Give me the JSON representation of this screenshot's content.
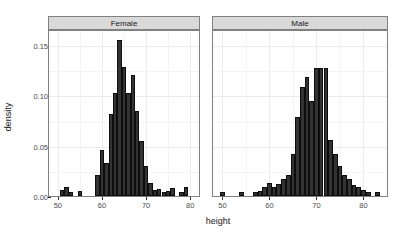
{
  "chart_data": {
    "type": "bar",
    "title": "",
    "subtitle": "",
    "xlabel": "height",
    "ylabel": "density",
    "grid": true,
    "legend": "none",
    "facet_variable": "sex",
    "bin_width": 1,
    "xlim": [
      48,
      85
    ],
    "ylim": [
      0,
      0.165
    ],
    "x_ticks": [
      50,
      60,
      70,
      80
    ],
    "x_tick_labels": [
      "50",
      "60",
      "70",
      "80"
    ],
    "y_ticks": [
      0.0,
      0.05,
      0.1,
      0.15
    ],
    "y_tick_labels": [
      "0.00",
      "0.05",
      "0.10",
      "0.15"
    ],
    "panels": [
      {
        "label": "Female",
        "xlim": [
          48,
          82
        ],
        "x": [
          51,
          52,
          53,
          54,
          55,
          56,
          57,
          58,
          59,
          60,
          61,
          62,
          63,
          64,
          65,
          66,
          67,
          68,
          69,
          70,
          71,
          72,
          73,
          74,
          75,
          76,
          77,
          78,
          79,
          80
        ],
        "values": [
          0.006,
          0.009,
          0.004,
          0.0,
          0.005,
          0.0,
          0.0,
          0.0,
          0.021,
          0.046,
          0.033,
          0.082,
          0.102,
          0.155,
          0.128,
          0.102,
          0.12,
          0.085,
          0.055,
          0.03,
          0.013,
          0.006,
          0.007,
          0.004,
          0.005,
          0.008,
          0.0,
          0.004,
          0.009,
          0.0
        ]
      },
      {
        "label": "Male",
        "xlim": [
          48,
          85
        ],
        "x": [
          50,
          54,
          57,
          58,
          59,
          60,
          61,
          62,
          63,
          64,
          65,
          66,
          67,
          68,
          69,
          70,
          71,
          72,
          73,
          74,
          75,
          76,
          77,
          78,
          79,
          80,
          81,
          83
        ],
        "values": [
          0.004,
          0.004,
          0.004,
          0.005,
          0.009,
          0.013,
          0.009,
          0.012,
          0.017,
          0.021,
          0.042,
          0.079,
          0.108,
          0.118,
          0.094,
          0.127,
          0.127,
          0.127,
          0.056,
          0.042,
          0.03,
          0.021,
          0.017,
          0.011,
          0.009,
          0.006,
          0.004,
          0.004
        ]
      }
    ]
  },
  "axes": {
    "ylabel": "density",
    "xlabel": "height"
  },
  "strips": {
    "female": "Female",
    "male": "Male"
  },
  "yticks": [
    {
      "label": "0.15",
      "value": 0.15
    },
    {
      "label": "0.10",
      "value": 0.1
    },
    {
      "label": "0.05",
      "value": 0.05
    },
    {
      "label": "0.00",
      "value": 0.0
    }
  ],
  "xticks_female": [
    {
      "label": "50",
      "value": 50
    },
    {
      "label": "60",
      "value": 60
    },
    {
      "label": "70",
      "value": 70
    },
    {
      "label": "80",
      "value": 80
    }
  ],
  "xticks_male": [
    {
      "label": "50",
      "value": 50
    },
    {
      "label": "60",
      "value": 60
    },
    {
      "label": "70",
      "value": 70
    },
    {
      "label": "80",
      "value": 80
    }
  ],
  "colors": {
    "bar_fill": "#333333",
    "bar_stroke": "#0d0d0d",
    "strip_background": "#d9d9d9",
    "panel_border": "#808080",
    "gridline_major": "#ebebeb",
    "gridline_minor": "#f4f4f4",
    "text": "#1a1a1a",
    "tick_text": "#4d4d4d",
    "background": "#ffffff"
  }
}
